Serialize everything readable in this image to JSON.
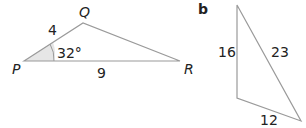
{
  "diagram": {
    "part_a": {
      "vertices": {
        "P": "P",
        "Q": "Q",
        "R": "R"
      },
      "side_PQ": "4",
      "side_PR": "9",
      "angle_P": "32°",
      "line_color": "#9a9a9a",
      "angle_fill": "#e6e6e6"
    },
    "part_b": {
      "label": "b",
      "side_left": "16",
      "side_hypotenuse": "23",
      "side_bottom": "12",
      "line_color": "#9a9a9a"
    }
  }
}
